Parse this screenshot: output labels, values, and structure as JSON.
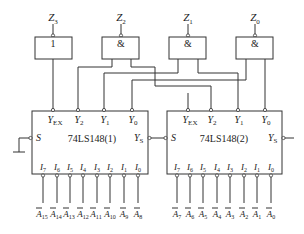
{
  "gates": [
    {
      "id": "G3",
      "output": "Z",
      "output_sub": "3",
      "symbol": "1"
    },
    {
      "id": "G2",
      "output": "Z",
      "output_sub": "2",
      "symbol": "&"
    },
    {
      "id": "G1",
      "output": "Z",
      "output_sub": "1",
      "symbol": "&"
    },
    {
      "id": "G0",
      "output": "Z",
      "output_sub": "0",
      "symbol": "&"
    }
  ],
  "chips": [
    {
      "name": "74LS148(1)",
      "outputs": [
        {
          "main": "Y",
          "sub": "EX"
        },
        {
          "main": "Y",
          "sub": "2"
        },
        {
          "main": "Y",
          "sub": "1"
        },
        {
          "main": "Y",
          "sub": "0"
        }
      ],
      "s_label": "S",
      "ys_label": "Y",
      "ys_sub": "S",
      "inputs": [
        {
          "main": "I",
          "sub": "7"
        },
        {
          "main": "I",
          "sub": "6"
        },
        {
          "main": "I",
          "sub": "5"
        },
        {
          "main": "I",
          "sub": "4"
        },
        {
          "main": "I",
          "sub": "3"
        },
        {
          "main": "I",
          "sub": "2"
        },
        {
          "main": "I",
          "sub": "1"
        },
        {
          "main": "I",
          "sub": "0"
        }
      ],
      "signals": [
        {
          "main": "A",
          "sub": "15"
        },
        {
          "main": "A",
          "sub": "14"
        },
        {
          "main": "A",
          "sub": "13"
        },
        {
          "main": "A",
          "sub": "12"
        },
        {
          "main": "A",
          "sub": "11"
        },
        {
          "main": "A",
          "sub": "10"
        },
        {
          "main": "A",
          "sub": "9"
        },
        {
          "main": "A",
          "sub": "8"
        }
      ]
    },
    {
      "name": "74LS148(2)",
      "outputs": [
        {
          "main": "Y",
          "sub": "EX"
        },
        {
          "main": "Y",
          "sub": "2"
        },
        {
          "main": "Y",
          "sub": "1"
        },
        {
          "main": "Y",
          "sub": "0"
        }
      ],
      "s_label": "S",
      "ys_label": "Y",
      "ys_sub": "S",
      "inputs": [
        {
          "main": "I",
          "sub": "7"
        },
        {
          "main": "I",
          "sub": "6"
        },
        {
          "main": "I",
          "sub": "5"
        },
        {
          "main": "I",
          "sub": "4"
        },
        {
          "main": "I",
          "sub": "3"
        },
        {
          "main": "I",
          "sub": "2"
        },
        {
          "main": "I",
          "sub": "1"
        },
        {
          "main": "I",
          "sub": "0"
        }
      ],
      "signals": [
        {
          "main": "A",
          "sub": "7"
        },
        {
          "main": "A",
          "sub": "6"
        },
        {
          "main": "A",
          "sub": "5"
        },
        {
          "main": "A",
          "sub": "4"
        },
        {
          "main": "A",
          "sub": "3"
        },
        {
          "main": "A",
          "sub": "2"
        },
        {
          "main": "A",
          "sub": "1"
        },
        {
          "main": "A",
          "sub": "0"
        }
      ]
    }
  ]
}
